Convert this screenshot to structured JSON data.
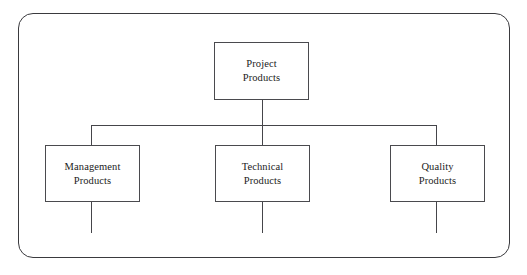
{
  "diagram": {
    "type": "hierarchy-tree",
    "style": {
      "background": "#ffffff",
      "line_color": "#45454a",
      "frame_color": "#3a3a3e",
      "text_color": "#1b1b1b",
      "node_fill": "#ffffff"
    },
    "nodes": [
      {
        "id": "root",
        "line1": "Project",
        "line2": "Products",
        "level": 0
      },
      {
        "id": "management",
        "line1": "Management",
        "line2": "Products",
        "level": 1
      },
      {
        "id": "technical",
        "line1": "Technical",
        "line2": "Products",
        "level": 1
      },
      {
        "id": "quality",
        "line1": "Quality",
        "line2": "Products",
        "level": 1
      }
    ],
    "edges": [
      {
        "from": "root",
        "to": "bus"
      },
      {
        "from": "bus",
        "to": "management"
      },
      {
        "from": "bus",
        "to": "technical"
      },
      {
        "from": "bus",
        "to": "quality"
      },
      {
        "from": "management",
        "to": "continues-below"
      },
      {
        "from": "technical",
        "to": "continues-below"
      },
      {
        "from": "quality",
        "to": "continues-below"
      }
    ]
  }
}
